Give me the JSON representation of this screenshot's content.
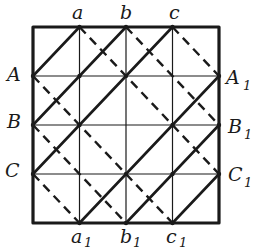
{
  "diagram": {
    "type": "grid-diagonal-pattern",
    "grid": {
      "cols": 4,
      "rows": 4
    },
    "box": {
      "x0": 33,
      "y0": 27,
      "x1": 219,
      "y1": 223
    },
    "colors": {
      "ink": "#1a1a1a",
      "background": "#ffffff"
    },
    "labels": {
      "top": [
        {
          "id": "a",
          "text": "a",
          "sub": ""
        },
        {
          "id": "b",
          "text": "b",
          "sub": ""
        },
        {
          "id": "c",
          "text": "c",
          "sub": ""
        }
      ],
      "bottom": [
        {
          "id": "a1",
          "text": "a",
          "sub": "1"
        },
        {
          "id": "b1",
          "text": "b",
          "sub": "1"
        },
        {
          "id": "c1",
          "text": "c",
          "sub": "1"
        }
      ],
      "left": [
        {
          "id": "A",
          "text": "A",
          "sub": ""
        },
        {
          "id": "B",
          "text": "B",
          "sub": ""
        },
        {
          "id": "C",
          "text": "C",
          "sub": ""
        }
      ],
      "right": [
        {
          "id": "A1",
          "text": "A",
          "sub": "1"
        },
        {
          "id": "B1",
          "text": "B",
          "sub": "1"
        },
        {
          "id": "C1",
          "text": "C",
          "sub": "1"
        }
      ]
    },
    "solid_lines": [
      {
        "from": "A",
        "to": "a",
        "p1": [
          0,
          1
        ],
        "p2": [
          1,
          0
        ]
      },
      {
        "from": "B",
        "to": "b",
        "p1": [
          0,
          2
        ],
        "p2": [
          2,
          0
        ]
      },
      {
        "from": "C",
        "to": "c",
        "p1": [
          0,
          3
        ],
        "p2": [
          3,
          0
        ]
      },
      {
        "from": "a1",
        "to": "A1",
        "p1": [
          1,
          4
        ],
        "p2": [
          4,
          1
        ]
      },
      {
        "from": "b1",
        "to": "B1",
        "p1": [
          2,
          4
        ],
        "p2": [
          4,
          2
        ]
      },
      {
        "from": "c1",
        "to": "C1",
        "p1": [
          3,
          4
        ],
        "p2": [
          4,
          3
        ]
      }
    ],
    "dashed_lines": [
      {
        "from": "C",
        "to": "a1",
        "p1": [
          0,
          3
        ],
        "p2": [
          1,
          4
        ]
      },
      {
        "from": "B",
        "to": "b1",
        "p1": [
          0,
          2
        ],
        "p2": [
          2,
          4
        ]
      },
      {
        "from": "A",
        "to": "c1",
        "p1": [
          0,
          1
        ],
        "p2": [
          3,
          4
        ]
      },
      {
        "from": "a",
        "to": "C1",
        "p1": [
          1,
          0
        ],
        "p2": [
          4,
          3
        ]
      },
      {
        "from": "b",
        "to": "B1",
        "p1": [
          2,
          0
        ],
        "p2": [
          4,
          2
        ]
      },
      {
        "from": "c",
        "to": "A1",
        "p1": [
          3,
          0
        ],
        "p2": [
          4,
          1
        ]
      }
    ]
  }
}
